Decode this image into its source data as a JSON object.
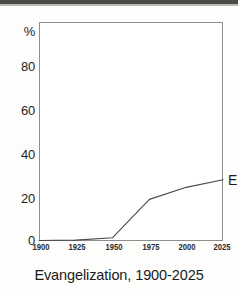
{
  "figure": {
    "title": "Evangelization, 1900-2025",
    "top_band_color": "#4a4a48",
    "background_color": "#fdfdfc",
    "plot_background_color": "#ffffff",
    "frame_color": "#8d8d8d",
    "line_color": "#4a4a4a"
  },
  "axes": {
    "y_unit_label": "%",
    "y_ticks": [
      "80",
      "60",
      "40",
      "20",
      "0"
    ],
    "x_ticks": [
      "1900",
      "1925",
      "1950",
      "1975",
      "2000",
      "2025"
    ]
  },
  "annotations": {
    "series_end_label": "E"
  },
  "chart_data": {
    "type": "line",
    "title": "Evangelization, 1900-2025",
    "xlabel": "",
    "ylabel": "%",
    "xlim": [
      1900,
      2025
    ],
    "ylim": [
      0,
      100
    ],
    "grid": false,
    "legend": "none",
    "x_tick_values": [
      1900,
      1925,
      1950,
      1975,
      2000,
      2025
    ],
    "y_tick_values": [
      0,
      20,
      40,
      60,
      80,
      100
    ],
    "y_tick_labels": [
      "0",
      "20",
      "40",
      "60",
      "80",
      "%"
    ],
    "series": [
      {
        "name": "E",
        "x": [
          1900,
          1925,
          1950,
          1975,
          2000,
          2025
        ],
        "values": [
          0.2,
          0.4,
          1.5,
          19.0,
          24.5,
          28.0
        ]
      }
    ]
  }
}
